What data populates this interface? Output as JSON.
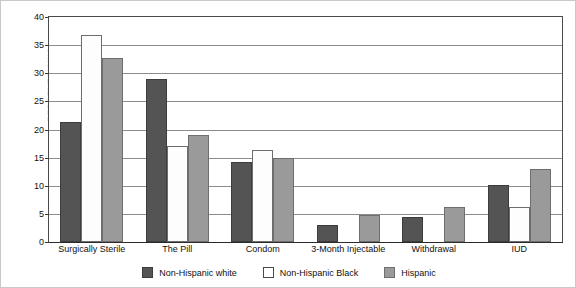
{
  "chart_data": {
    "type": "bar",
    "title": "",
    "xlabel": "",
    "ylabel": "PERCENT USING",
    "ylim": [
      0,
      40
    ],
    "yticks": [
      0,
      5,
      10,
      15,
      20,
      25,
      30,
      35,
      40
    ],
    "ytick_labels": [
      "0",
      "5",
      "10",
      "15",
      "20",
      "25",
      "30",
      "35",
      "40"
    ],
    "grid": true,
    "legend_position": "bottom-center",
    "categories": [
      "Surgically Sterile",
      "The Pill",
      "Condom",
      "3-Month Injectable",
      "Withdrawal",
      "IUD"
    ],
    "series": [
      {
        "name": "Non-Hispanic white",
        "color": "#545454",
        "values": [
          21.4,
          29.0,
          14.2,
          3.0,
          4.5,
          10.2
        ]
      },
      {
        "name": "Non-Hispanic Black",
        "color": "#ffffff",
        "values": [
          36.8,
          17.0,
          16.3,
          0.0,
          0.0,
          6.3
        ]
      },
      {
        "name": "Hispanic",
        "color": "#9a9a9a",
        "values": [
          32.8,
          19.0,
          15.0,
          4.8,
          6.2,
          13.0
        ]
      }
    ]
  }
}
